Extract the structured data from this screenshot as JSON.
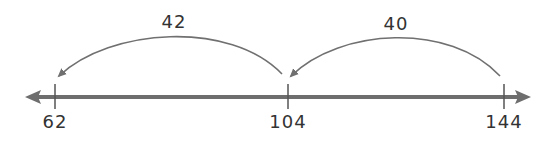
{
  "diagram": {
    "type": "number-line-subtraction",
    "colors": {
      "line": "#6e6e6e",
      "arc": "#707070",
      "text": "#333333",
      "background": "#ffffff"
    },
    "ticks": [
      {
        "value": "62",
        "x": 55
      },
      {
        "value": "104",
        "x": 288
      },
      {
        "value": "144",
        "x": 504
      }
    ],
    "jumps": [
      {
        "label": "40",
        "from": "144",
        "to": "104",
        "direction": "left"
      },
      {
        "label": "42",
        "from": "104",
        "to": "62",
        "direction": "left"
      }
    ]
  }
}
